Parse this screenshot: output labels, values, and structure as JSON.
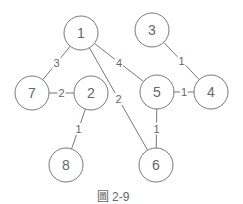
{
  "caption": "圖 2-9",
  "colors": {
    "stroke": "#777777",
    "text": "#666666",
    "background": "#ffffff"
  },
  "nodes": [
    {
      "id": "1",
      "x": 81,
      "y": 33
    },
    {
      "id": "3",
      "x": 152,
      "y": 30
    },
    {
      "id": "7",
      "x": 32,
      "y": 93
    },
    {
      "id": "2",
      "x": 91,
      "y": 93
    },
    {
      "id": "5",
      "x": 157,
      "y": 92
    },
    {
      "id": "4",
      "x": 211,
      "y": 92
    },
    {
      "id": "8",
      "x": 66,
      "y": 165
    },
    {
      "id": "6",
      "x": 156,
      "y": 165
    }
  ],
  "edges": [
    {
      "from": "1",
      "to": "7",
      "weight": "3"
    },
    {
      "from": "1",
      "to": "5",
      "weight": "4"
    },
    {
      "from": "1",
      "to": "6",
      "weight": "2"
    },
    {
      "from": "3",
      "to": "4",
      "weight": "1"
    },
    {
      "from": "7",
      "to": "2",
      "weight": "2"
    },
    {
      "from": "5",
      "to": "4",
      "weight": "1"
    },
    {
      "from": "2",
      "to": "8",
      "weight": "1"
    },
    {
      "from": "5",
      "to": "6",
      "weight": "1"
    }
  ]
}
